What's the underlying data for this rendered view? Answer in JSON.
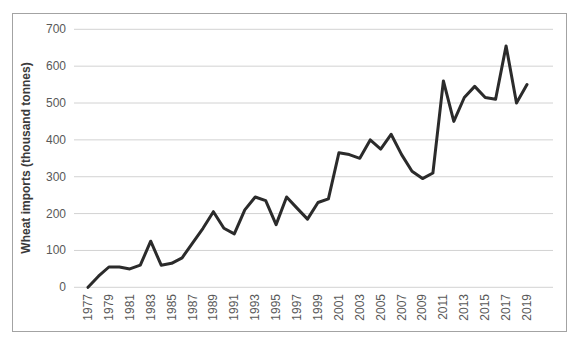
{
  "figure": {
    "ylabel": "Wheat imports (thousand tonnes)"
  },
  "chart_data": {
    "type": "line",
    "title": "",
    "xlabel": "",
    "ylabel": "Wheat imports (thousand tonnes)",
    "x": [
      1977,
      1978,
      1979,
      1980,
      1981,
      1982,
      1983,
      1984,
      1985,
      1986,
      1987,
      1988,
      1989,
      1990,
      1991,
      1992,
      1993,
      1994,
      1995,
      1996,
      1997,
      1998,
      1999,
      2000,
      2001,
      2002,
      2003,
      2004,
      2005,
      2006,
      2007,
      2008,
      2009,
      2010,
      2011,
      2012,
      2013,
      2014,
      2015,
      2016,
      2017,
      2018,
      2019
    ],
    "values": [
      0,
      30,
      55,
      55,
      50,
      60,
      125,
      60,
      65,
      80,
      120,
      160,
      205,
      160,
      145,
      210,
      245,
      235,
      170,
      245,
      215,
      185,
      230,
      240,
      365,
      360,
      350,
      400,
      375,
      415,
      360,
      315,
      295,
      310,
      560,
      450,
      515,
      545,
      515,
      510,
      655,
      500,
      550
    ],
    "x_tick_labels": [
      "1977",
      "1979",
      "1981",
      "1983",
      "1985",
      "1987",
      "1989",
      "1991",
      "1993",
      "1995",
      "1997",
      "1999",
      "2001",
      "2003",
      "2005",
      "2007",
      "2009",
      "2011",
      "2013",
      "2015",
      "2017",
      "2019"
    ],
    "y_ticks": [
      0,
      100,
      200,
      300,
      400,
      500,
      600,
      700
    ],
    "ylim": [
      0,
      700
    ],
    "xlim": [
      1977,
      2019
    ],
    "grid": "horizontal",
    "legend": "none",
    "series_name": "Wheat imports",
    "line_color": "#2b2b2b",
    "grid_color": "#d2d2d2",
    "tick_text_color": "#595959",
    "title_text_color": "#3a3a3a",
    "frame_border_color": "#a3a3a3",
    "background_color": "#ffffff"
  }
}
